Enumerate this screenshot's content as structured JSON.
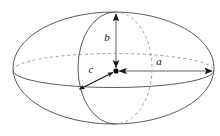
{
  "figure": {
    "name": "triaxial-ellipsoid",
    "background_color": "#ffffff",
    "width": 220,
    "height": 136
  },
  "labels": {
    "a": "a",
    "b": "b",
    "c": "c"
  },
  "colors": {
    "outline": "#4a4a4a",
    "hidden_outline": "#8a8a8a",
    "axis_gray": "#9a9a9a",
    "axis_black": "#1a1a1a",
    "label": "#151515",
    "center_dot": "#000000"
  },
  "geometry": {
    "center": {
      "x": 116,
      "y": 71
    },
    "outer_ellipse": {
      "cx": 113.5,
      "cy": 68,
      "rx": 100.5,
      "ry": 56
    },
    "equator_ellipse": {
      "cx": 113.5,
      "cy": 70.5,
      "rx": 100.5,
      "ry": 17
    },
    "meridian_ellipse": {
      "cx": 115,
      "cy": 68,
      "rx": 37,
      "ry": 56
    }
  },
  "axes": [
    {
      "id": "a",
      "label": "a",
      "direction": "right",
      "style": "double-headed-arrow",
      "color": "#9a9a9a",
      "from": {
        "x": 116,
        "y": 71
      },
      "to": {
        "x": 213,
        "y": 71
      },
      "label_pos": {
        "x": 159,
        "y": 62
      }
    },
    {
      "id": "b",
      "label": "b",
      "direction": "up",
      "style": "double-headed-arrow",
      "color": "#9a9a9a",
      "from": {
        "x": 116,
        "y": 71
      },
      "to": {
        "x": 116,
        "y": 13
      },
      "label_pos": {
        "x": 107,
        "y": 38
      }
    },
    {
      "id": "c",
      "label": "c",
      "direction": "down-left",
      "style": "double-headed-arrow",
      "color": "#1a1a1a",
      "from": {
        "x": 116,
        "y": 71
      },
      "to": {
        "x": 78,
        "y": 90
      },
      "label_pos": {
        "x": 91,
        "y": 70
      }
    }
  ]
}
